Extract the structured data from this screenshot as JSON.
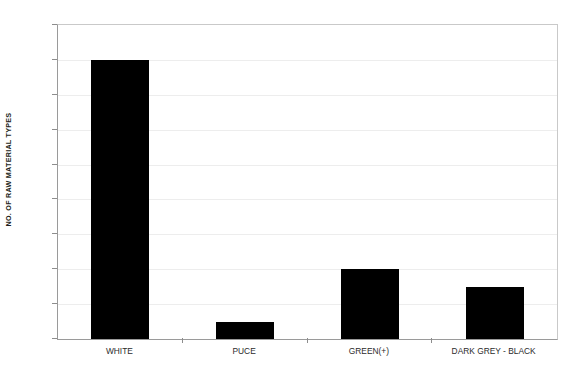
{
  "chart_data": {
    "type": "bar",
    "title": "",
    "subtitle": "",
    "xlabel": "",
    "ylabel": "NO. OF RAW MATERIAL TYPES",
    "categories": [
      "WHITE",
      "PUCE",
      "GREEN(+)",
      "DARK GREY - BLACK"
    ],
    "values": [
      16,
      1,
      4,
      3
    ],
    "series": [
      {
        "name": "No. of raw material types",
        "values": [
          16,
          1,
          4,
          3
        ]
      }
    ],
    "ylim": [
      0,
      18
    ],
    "ytick_step": 2,
    "yticks": [
      0,
      2,
      4,
      6,
      8,
      10,
      12,
      14,
      16,
      18
    ],
    "ytick_labels": [
      "0",
      "2",
      "4",
      "6",
      "8",
      "10",
      "12",
      "14",
      "16",
      "18"
    ],
    "grid": true,
    "grid_axis": "y",
    "legend": false,
    "legend_position": "none",
    "bar_color": "#000000",
    "gridline_color": "#ededed",
    "axis_color": "#9a9a9a",
    "background_color": "#ffffff",
    "annotations": []
  }
}
